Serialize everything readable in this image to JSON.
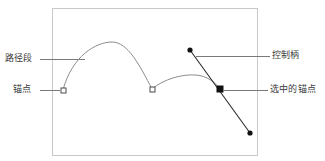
{
  "diagram": {
    "frame": {
      "x": 52,
      "y": 8,
      "width": 205,
      "height": 147,
      "stroke": "#c9c9c9"
    },
    "colors": {
      "frame": "#c9c9c9",
      "path_curve": "#8d8d8d",
      "leader_line": "#7a7a7a",
      "handle_line": "#2b2b2b",
      "anchor_stroke": "#4a4a4a",
      "anchor_fill": "#ffffff",
      "selected_anchor_fill": "#111111",
      "control_dot_fill": "#111111",
      "text": "#3b3b3b",
      "background": "#ffffff"
    },
    "labels": [
      {
        "id": "path-segment",
        "text": "路径段",
        "side": "left",
        "text_x": 5,
        "text_y": 53,
        "leader": {
          "x1": 40,
          "y1": 59,
          "x2": 85,
          "y2": 59
        }
      },
      {
        "id": "anchor-point",
        "text": "锚点",
        "side": "left",
        "text_x": 13,
        "text_y": 84,
        "leader": {
          "x1": 40,
          "y1": 90,
          "x2": 60,
          "y2": 90
        }
      },
      {
        "id": "control-handle",
        "text": "控制柄",
        "side": "right",
        "text_x": 272,
        "text_y": 50,
        "leader": {
          "x1": 196,
          "y1": 56,
          "x2": 270,
          "y2": 56
        }
      },
      {
        "id": "selected-anchor",
        "text": "选中的锚点",
        "side": "right",
        "text_x": 270,
        "text_y": 84,
        "leader": {
          "x1": 224,
          "y1": 90,
          "x2": 268,
          "y2": 90
        }
      }
    ],
    "path": {
      "description": "两段弧形路径",
      "d": "M 63 90 C 72 56 96 42 112 42 C 128 42 140 66 152 89 C 164 79 182 74 196 75 C 207 76 215 82 220 89"
    },
    "anchors": [
      {
        "id": "anchor-1",
        "x": 63,
        "y": 90,
        "selected": false,
        "size": 5
      },
      {
        "id": "anchor-2",
        "x": 152,
        "y": 89,
        "selected": false,
        "size": 5
      },
      {
        "id": "anchor-3",
        "x": 220,
        "y": 89,
        "selected": true,
        "size": 6
      }
    ],
    "control_handle": {
      "line": {
        "x1": 190,
        "y1": 50,
        "x2": 250,
        "y2": 133
      },
      "anchor": {
        "x": 220,
        "y": 89
      },
      "dots": [
        {
          "id": "control-dot-top",
          "x": 190,
          "y": 50,
          "r": 2.6
        },
        {
          "id": "control-dot-bottom",
          "x": 250,
          "y": 133,
          "r": 2.6
        }
      ]
    }
  }
}
